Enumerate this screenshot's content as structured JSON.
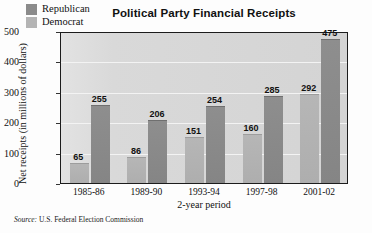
{
  "chart_data": {
    "type": "bar",
    "title": "Political Party Financial Receipts",
    "xlabel": "2-year period",
    "ylabel": "Net receipts (in millions of dollars)",
    "categories": [
      "1985-86",
      "1989-90",
      "1993-94",
      "1997-98",
      "2001-02"
    ],
    "series": [
      {
        "name": "Democrat",
        "values": [
          65,
          86,
          151,
          160,
          292
        ],
        "color": "#b4b4b4"
      },
      {
        "name": "Republican",
        "values": [
          255,
          206,
          254,
          285,
          475
        ],
        "color": "#8b8b8b"
      }
    ],
    "ylim": [
      0,
      500
    ],
    "yticks": [
      0,
      100,
      200,
      300,
      400,
      500
    ],
    "ytick_labels": [
      "0",
      "100",
      "200",
      "300",
      "400",
      "500"
    ],
    "grid": true,
    "legend_position": "top-left-inside",
    "legend_entries": [
      "Republican",
      "Democrat"
    ]
  },
  "source": {
    "prefix": "Source:",
    "text": "U.S. Federal Election Commission"
  }
}
